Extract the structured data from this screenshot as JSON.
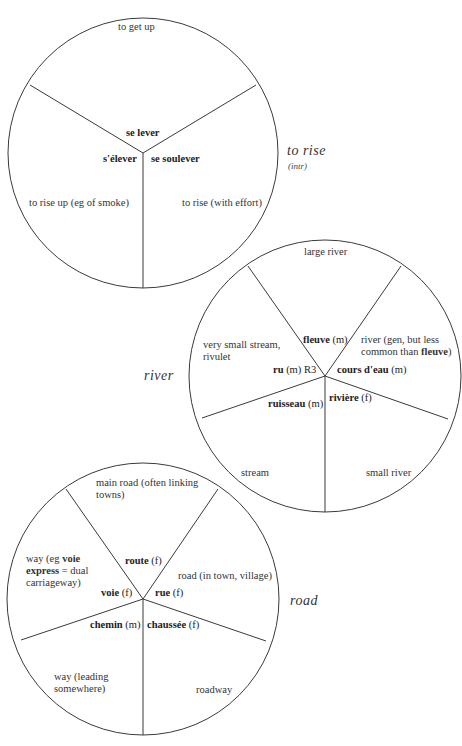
{
  "diagrams": [
    {
      "id": "to-rise",
      "title": "to rise",
      "subtitle": "(intr)",
      "circle": {
        "cx": 143,
        "cy": 153,
        "r": 135
      },
      "spoke_ends": [
        [
          30,
          85
        ],
        [
          256,
          85
        ],
        [
          143,
          288
        ]
      ],
      "terms": [
        {
          "word": "se lever",
          "gender": "",
          "reg": ""
        },
        {
          "word": "s'élever",
          "gender": "",
          "reg": ""
        },
        {
          "word": "se soulever",
          "gender": "",
          "reg": ""
        }
      ],
      "meanings": [
        "to get up",
        "to rise up (eg of smoke)",
        "to rise (with effort)"
      ]
    },
    {
      "id": "river",
      "title": "river",
      "circle": {
        "cx": 325,
        "cy": 376,
        "r": 136
      },
      "spoke_ends": [
        [
          248,
          266
        ],
        [
          401,
          266
        ],
        [
          202,
          418
        ],
        [
          448,
          419
        ],
        [
          325,
          512
        ]
      ],
      "terms": [
        {
          "word": "fleuve",
          "gender": "(m)",
          "reg": ""
        },
        {
          "word": "ru",
          "gender": "(m)",
          "reg": "R3"
        },
        {
          "word": "cours d'eau",
          "gender": "(m)",
          "reg": ""
        },
        {
          "word": "ruisseau",
          "gender": "(m)",
          "reg": ""
        },
        {
          "word": "rivière",
          "gender": "(f)",
          "reg": ""
        }
      ],
      "meanings": [
        "large river",
        "very small stream, rivulet",
        "river (gen, but less common than fleuve)",
        "stream",
        "small river"
      ]
    },
    {
      "id": "road",
      "title": "road",
      "circle": {
        "cx": 143,
        "cy": 599,
        "r": 136
      },
      "spoke_ends": [
        [
          66,
          489
        ],
        [
          218,
          489
        ],
        [
          21,
          640
        ],
        [
          266,
          641
        ],
        [
          143,
          735
        ]
      ],
      "terms": [
        {
          "word": "route",
          "gender": "(f)",
          "reg": ""
        },
        {
          "word": "voie",
          "gender": "(f)",
          "reg": ""
        },
        {
          "word": "rue",
          "gender": "(f)",
          "reg": ""
        },
        {
          "word": "chemin",
          "gender": "(m)",
          "reg": ""
        },
        {
          "word": "chaussée",
          "gender": "(f)",
          "reg": ""
        }
      ],
      "meanings": [
        "main road (often linking towns)",
        "way (eg voie express = dual carriageway)",
        "road (in town, village)",
        "way (leading somewhere)",
        "roadway"
      ]
    }
  ],
  "style": {
    "line_color": "#3a3a3a",
    "text_color": "#333333",
    "background": "#ffffff"
  }
}
